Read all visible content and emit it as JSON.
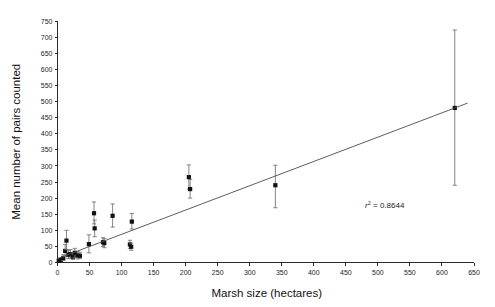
{
  "chart_data": {
    "type": "scatter",
    "title": "",
    "xlabel": "Marsh size (hectares)",
    "ylabel": "Mean number of pairs counted",
    "xlim": [
      0,
      650
    ],
    "ylim": [
      0,
      750
    ],
    "xticks": [
      0,
      50,
      100,
      150,
      200,
      250,
      300,
      350,
      400,
      450,
      500,
      550,
      600,
      650
    ],
    "yticks": [
      0,
      50,
      100,
      150,
      200,
      250,
      300,
      350,
      400,
      450,
      500,
      550,
      600,
      650,
      700,
      750
    ],
    "grid": false,
    "legend": null,
    "annotations": [
      {
        "name": "r-squared-label",
        "text": "r",
        "superscript": "2",
        "tail": " = 0.8644",
        "full_text": "r² = 0.8644",
        "x": 480,
        "y": 170
      }
    ],
    "trendline": {
      "name": "linear-regression-line",
      "x_start": 0,
      "x_end": 640,
      "y_start": 12,
      "y_end": 495,
      "r_squared": 0.8644
    },
    "error_bar_type": "symmetric-standard-error",
    "points": [
      {
        "x": 2,
        "y": 5,
        "ylow": 2,
        "yhigh": 10
      },
      {
        "x": 5,
        "y": 8,
        "ylow": 3,
        "yhigh": 14
      },
      {
        "x": 9,
        "y": 14,
        "ylow": 6,
        "yhigh": 24
      },
      {
        "x": 12,
        "y": 36,
        "ylow": 18,
        "yhigh": 56
      },
      {
        "x": 14,
        "y": 68,
        "ylow": 40,
        "yhigh": 100
      },
      {
        "x": 17,
        "y": 24,
        "ylow": 12,
        "yhigh": 38
      },
      {
        "x": 20,
        "y": 26,
        "ylow": 14,
        "yhigh": 40
      },
      {
        "x": 24,
        "y": 18,
        "ylow": 9,
        "yhigh": 29
      },
      {
        "x": 27,
        "y": 30,
        "ylow": 16,
        "yhigh": 44
      },
      {
        "x": 31,
        "y": 22,
        "ylow": 11,
        "yhigh": 34
      },
      {
        "x": 35,
        "y": 21,
        "ylow": 12,
        "yhigh": 32
      },
      {
        "x": 49,
        "y": 57,
        "ylow": 30,
        "yhigh": 86
      },
      {
        "x": 57,
        "y": 153,
        "ylow": 120,
        "yhigh": 188
      },
      {
        "x": 58,
        "y": 106,
        "ylow": 80,
        "yhigh": 132
      },
      {
        "x": 71,
        "y": 63,
        "ylow": 50,
        "yhigh": 77
      },
      {
        "x": 73,
        "y": 60,
        "ylow": 46,
        "yhigh": 74
      },
      {
        "x": 86,
        "y": 145,
        "ylow": 110,
        "yhigh": 182
      },
      {
        "x": 113,
        "y": 56,
        "ylow": 44,
        "yhigh": 69
      },
      {
        "x": 115,
        "y": 49,
        "ylow": 38,
        "yhigh": 60
      },
      {
        "x": 116,
        "y": 127,
        "ylow": 104,
        "yhigh": 152
      },
      {
        "x": 205,
        "y": 265,
        "ylow": 228,
        "yhigh": 303
      },
      {
        "x": 207,
        "y": 228,
        "ylow": 200,
        "yhigh": 258
      },
      {
        "x": 340,
        "y": 240,
        "ylow": 170,
        "yhigh": 302
      },
      {
        "x": 620,
        "y": 480,
        "ylow": 240,
        "yhigh": 722
      }
    ]
  },
  "axes": {
    "x_title": "Marsh size (hectares)",
    "y_title": "Mean number of pairs counted"
  }
}
